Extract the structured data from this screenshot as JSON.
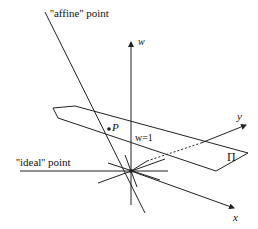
{
  "diagram": {
    "labels": {
      "affine_point": "''affine'' point",
      "ideal_point": "''ideal'' point",
      "w_axis": "w",
      "x_axis": "x",
      "y_axis": "y",
      "point_P": "P",
      "plane_eq": "w=1",
      "plane_name": "Π"
    },
    "colors": {
      "line": "#222222",
      "background": "#ffffff"
    }
  }
}
